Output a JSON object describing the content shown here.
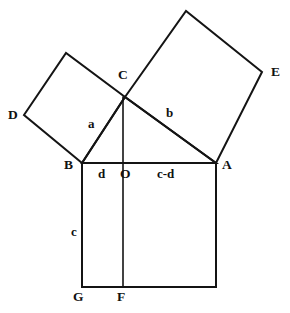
{
  "figure": {
    "background_color": "#ffffff",
    "stroke_color": "#141414",
    "text_color": "#111111"
  },
  "vertices": [
    {
      "id": "D",
      "label": "D",
      "x": 24,
      "y": 115,
      "label_x": 8,
      "label_y": 108
    },
    {
      "id": "C",
      "label": "C",
      "x": 125,
      "y": 97,
      "label_x": 118,
      "label_y": 68
    },
    {
      "id": "E",
      "label": "E",
      "x": 262,
      "y": 72,
      "label_x": 271,
      "label_y": 65
    },
    {
      "id": "B",
      "label": "B",
      "x": 82,
      "y": 163,
      "label_x": 64,
      "label_y": 158
    },
    {
      "id": "O",
      "label": "O",
      "x": 123,
      "y": 163,
      "label_x": 120,
      "label_y": 167
    },
    {
      "id": "A",
      "label": "A",
      "x": 216,
      "y": 163,
      "label_x": 222,
      "label_y": 158
    },
    {
      "id": "G",
      "label": "G",
      "x": 82,
      "y": 287,
      "label_x": 73,
      "label_y": 290
    },
    {
      "id": "F",
      "label": "F",
      "x": 123,
      "y": 287,
      "label_x": 117,
      "label_y": 290
    },
    {
      "id": "T1",
      "label": "",
      "x": 66,
      "y": 53,
      "label_x": 0,
      "label_y": 0
    },
    {
      "id": "T2",
      "label": "",
      "x": 186,
      "y": 11,
      "label_x": 0,
      "label_y": 0
    },
    {
      "id": "H",
      "label": "",
      "x": 216,
      "y": 287,
      "label_x": 0,
      "label_y": 0
    }
  ],
  "side_labels": [
    {
      "id": "a",
      "text": "a",
      "x": 88,
      "y": 117
    },
    {
      "id": "b",
      "text": "b",
      "x": 166,
      "y": 106
    },
    {
      "id": "c",
      "text": "c",
      "x": 71,
      "y": 225
    },
    {
      "id": "d",
      "text": "d",
      "x": 98,
      "y": 167
    },
    {
      "id": "c_d",
      "text": "c-d",
      "x": 157,
      "y": 167
    }
  ],
  "shapes": {
    "square_on_a": {
      "name": "square BDTC",
      "points": "82,163 24,115 66,53 125,97"
    },
    "square_on_b": {
      "name": "square CTEA",
      "points": "125,97 186,11 262,72 216,163"
    },
    "square_on_c": {
      "name": "square BAHG",
      "points": "82,163 216,163 216,287 82,287"
    },
    "triangle": {
      "name": "right triangle ABC",
      "points": "82,163 216,163 125,97"
    },
    "altitude": {
      "name": "altitude C to F",
      "x1": 123,
      "y1": 97,
      "x2": 123,
      "y2": 287
    }
  }
}
